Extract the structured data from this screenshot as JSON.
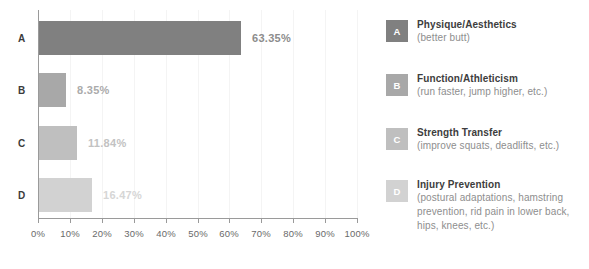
{
  "chart_data": {
    "type": "bar",
    "orientation": "horizontal",
    "title": "",
    "xlabel": "",
    "ylabel": "",
    "categories": [
      "A",
      "B",
      "C",
      "D"
    ],
    "values": [
      63.35,
      8.35,
      11.84,
      16.47
    ],
    "value_labels": [
      "63.35%",
      "8.35%",
      "11.84%",
      "16.47%"
    ],
    "xlim": [
      0,
      100
    ],
    "xticks": [
      0,
      10,
      20,
      30,
      40,
      50,
      60,
      70,
      80,
      90,
      100
    ],
    "xtick_labels": [
      "0%",
      "10%",
      "20%",
      "30%",
      "40%",
      "50%",
      "60%",
      "70%",
      "80%",
      "90%",
      "100%"
    ],
    "grid": "vertical-only",
    "legend_position": "right",
    "bar_colors": [
      "#808080",
      "#a8a8a8",
      "#bfbfbf",
      "#d2d2d2"
    ],
    "value_label_colors": [
      "#8c8c8c",
      "#ababab",
      "#c2c2c2",
      "#d6d6d6"
    ],
    "series": [
      {
        "name": "Training goal preference",
        "values": [
          63.35,
          8.35,
          11.84,
          16.47
        ]
      }
    ],
    "legend": [
      {
        "key": "A",
        "title": "Physique/Aesthetics",
        "subtitle": "(better butt)",
        "color": "#808080"
      },
      {
        "key": "B",
        "title": "Function/Athleticism",
        "subtitle": "(run faster, jump higher, etc.)",
        "color": "#a8a8a8"
      },
      {
        "key": "C",
        "title": "Strength Transfer",
        "subtitle": "(improve squats, deadlifts, etc.)",
        "color": "#bfbfbf"
      },
      {
        "key": "D",
        "title": "Injury Prevention",
        "subtitle": "(postural adaptations, hamstring prevention, rid pain in lower back, hips, knees, etc.)",
        "color": "#d2d2d2"
      }
    ]
  }
}
